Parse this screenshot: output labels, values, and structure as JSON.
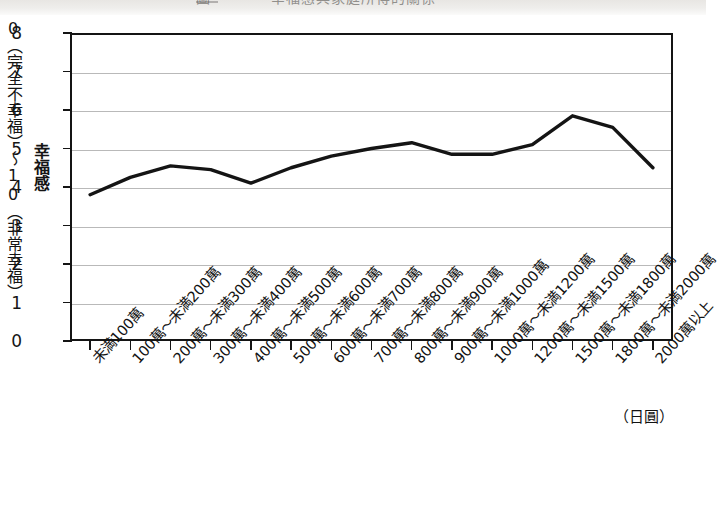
{
  "figure": {
    "clipped_title_text": "圖　　　　幸福感與家庭所得的關係",
    "background_color": "#ffffff",
    "line_color": "#141414",
    "grid_color": "#b9b9b9",
    "axis_color": "#141414"
  },
  "yaxis": {
    "title": "幸福感",
    "range_caption": "0（完全不幸福）〜10（非常幸福）",
    "ticks": [
      "8",
      "7",
      "6",
      "5",
      "4",
      "3",
      "2",
      "1",
      "0"
    ]
  },
  "xaxis": {
    "unit": "（日圓）",
    "categories": [
      "未満100萬",
      "100萬〜未満200萬",
      "200萬〜未満300萬",
      "300萬〜未満400萬",
      "400萬〜未満500萬",
      "500萬〜未満600萬",
      "600萬〜未満700萬",
      "700萬〜未満800萬",
      "800萬〜未満900萬",
      "900萬〜未満1000萬",
      "1000萬〜未満1200萬",
      "1200萬〜未満1500萬",
      "1500萬〜未満1800萬",
      "1800萬〜未満2000萬",
      "2000萬以上"
    ]
  },
  "chart_data": {
    "type": "line",
    "title": "幸福感與家庭所得的關係",
    "xlabel": "（日圓）",
    "ylabel": "幸福感",
    "ylim": [
      0,
      8
    ],
    "ytick_step": 1,
    "grid": true,
    "legend": "none",
    "categories": [
      "未満100萬",
      "100萬〜未満200萬",
      "200萬〜未満300萬",
      "300萬〜未満400萬",
      "400萬〜未満500萬",
      "500萬〜未満600萬",
      "600萬〜未満700萬",
      "700萬〜未満800萬",
      "800萬〜未満900萬",
      "900萬〜未満1000萬",
      "1000萬〜未満1200萬",
      "1200萬〜未満1500萬",
      "1500萬〜未満1800萬",
      "1800萬〜未満2000萬",
      "2000萬以上"
    ],
    "values": [
      3.8,
      4.25,
      4.55,
      4.45,
      4.1,
      4.5,
      4.8,
      5.0,
      5.15,
      4.85,
      4.85,
      5.1,
      5.85,
      5.55,
      4.5
    ]
  }
}
